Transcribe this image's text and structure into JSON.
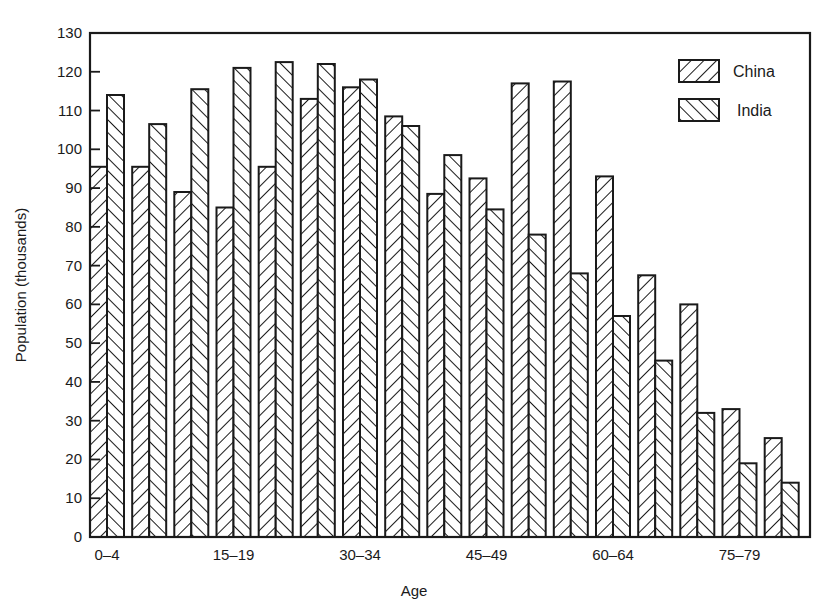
{
  "chart_data": {
    "type": "bar",
    "title": "",
    "xlabel": "Age",
    "ylabel": "Population (thousands)",
    "ylim": [
      0,
      130
    ],
    "yticks": [
      0,
      10,
      20,
      30,
      40,
      50,
      60,
      70,
      80,
      90,
      100,
      110,
      120,
      130
    ],
    "grid": false,
    "legend_position": "upper right",
    "categories": [
      "0-4",
      "5-9",
      "10-14",
      "15-19",
      "20-24",
      "25-29",
      "30-34",
      "35-39",
      "40-44",
      "45-49",
      "50-54",
      "55-59",
      "60-64",
      "65-69",
      "70-74",
      "75-79",
      "80+"
    ],
    "xtick_labels_shown": [
      "0-4",
      "15-19",
      "30-34",
      "45-49",
      "60-64",
      "75-79"
    ],
    "series": [
      {
        "name": "China",
        "pattern": "forward-hatch",
        "values": [
          95.5,
          95.5,
          89,
          85,
          95.5,
          113,
          116,
          108.5,
          88.5,
          92.5,
          117,
          117.5,
          93,
          67.5,
          60,
          33,
          25.5
        ]
      },
      {
        "name": "India",
        "pattern": "back-hatch",
        "values": [
          114,
          106.5,
          115.5,
          121,
          122.5,
          122,
          118,
          106,
          98.5,
          84.5,
          78,
          68,
          57,
          45.5,
          32,
          19,
          14
        ]
      }
    ]
  },
  "axes": {
    "ylabel": "Population (thousands)",
    "xlabel": "Age"
  },
  "legend": {
    "items": [
      {
        "label": "China"
      },
      {
        "label": "India"
      }
    ]
  },
  "colors": {
    "ink": "#1a1a1a",
    "background": "#ffffff"
  }
}
